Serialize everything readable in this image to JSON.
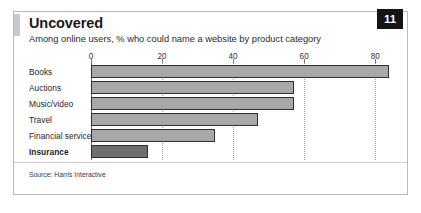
{
  "header": {
    "title": "Uncovered",
    "subtitle": "Among online users, % who could name a website by product category",
    "page_number": "11"
  },
  "footer": {
    "source": "Source: Harris Interactive"
  },
  "colors": {
    "bar_fill": "#a8a8a8",
    "bar_fill_highlight": "#6e6e6e",
    "bar_outline": "#2f2f2f",
    "badge_background": "#141414",
    "badge_text": "#ffffff",
    "frame_border": "#b9b9b9",
    "title_accent": "#c9c9c9",
    "gridline": "#9a9a9a"
  },
  "chart_data": {
    "type": "bar",
    "orientation": "horizontal",
    "title": "Uncovered",
    "subtitle": "Among online users, % who could name a website by product category",
    "xlabel": "",
    "ylabel": "",
    "xlim": [
      0,
      85
    ],
    "ticks": [
      0,
      20,
      40,
      60,
      80
    ],
    "tick_labels": [
      "0",
      "20",
      "40",
      "60",
      "80"
    ],
    "grid": true,
    "legend": false,
    "categories": [
      "Books",
      "Auctions",
      "Music/video",
      "Travel",
      "Financial services",
      "Insurance"
    ],
    "values": [
      84,
      57,
      57,
      47,
      35,
      16
    ],
    "highlight_category": "Insurance",
    "source": "Source: Harris Interactive"
  }
}
